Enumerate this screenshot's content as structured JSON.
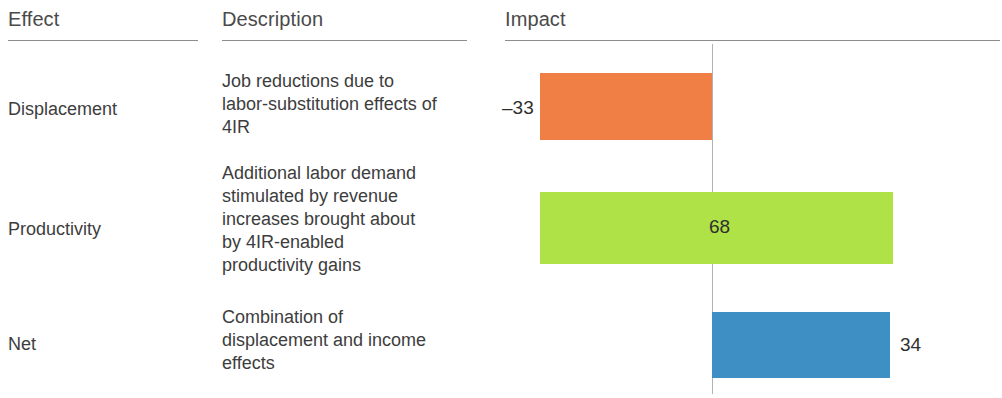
{
  "table": {
    "headers": {
      "effect": "Effect",
      "description": "Description",
      "impact": "Impact"
    },
    "rows": [
      {
        "effect": "Displacement",
        "description": "Job reductions due to labor-substitution effects of 4IR",
        "value_label": "–33"
      },
      {
        "effect": "Productivity",
        "description": "Additional labor demand stimulated by revenue increases brought about by 4IR-enabled productivity gains",
        "value_label": "68"
      },
      {
        "effect": "Net",
        "description": "Combination of displacement and income effects",
        "value_label": "34"
      }
    ]
  },
  "chart_data": {
    "type": "bar",
    "orientation": "horizontal",
    "title": "Impact",
    "xlabel": "",
    "ylabel": "",
    "categories": [
      "Displacement",
      "Productivity",
      "Net"
    ],
    "values": [
      -33,
      68,
      34
    ],
    "value_labels": [
      "–33",
      "68",
      "34"
    ],
    "colors": [
      "#F07F45",
      "#AFE247",
      "#3D8FC4"
    ],
    "zero_line": 0,
    "xlim": [
      -33,
      35
    ],
    "grid": false,
    "legend": null,
    "label_positions": [
      "outside-left",
      "inside",
      "outside-right"
    ]
  },
  "colors": {
    "displacement": "#F07F45",
    "productivity": "#AFE247",
    "net": "#3D8FC4",
    "zero_line": "#b2b2b2",
    "rule": "#8d8d8d",
    "text": "#3d3d3d",
    "background": "#ffffff"
  }
}
